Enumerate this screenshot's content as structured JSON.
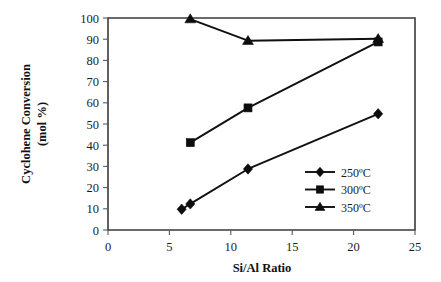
{
  "chart_data": {
    "type": "line",
    "title": "",
    "xlabel": "Si/Al Ratio",
    "ylabel_line1": "Cyclohene Conversion",
    "ylabel_line2": "(mol %)",
    "xlim": [
      0,
      25
    ],
    "ylim": [
      0,
      100
    ],
    "xticks": [
      "0",
      "5",
      "10",
      "15",
      "20",
      "25"
    ],
    "xtick_values": [
      0,
      5,
      10,
      15,
      20,
      25
    ],
    "yticks": [
      "0",
      "10",
      "20",
      "30",
      "40",
      "50",
      "60",
      "70",
      "80",
      "90",
      "100"
    ],
    "ytick_values": [
      0,
      10,
      20,
      30,
      40,
      50,
      60,
      70,
      80,
      90,
      100
    ],
    "grid": false,
    "legend_position": "lower-right-inside",
    "line_color": "#101010",
    "marker_color": "#0d0d0d",
    "frame_color": "#3a3a3a",
    "series": [
      {
        "name": "250ºC",
        "marker": "diamond",
        "x": [
          6.0,
          6.7,
          11.4,
          22.0
        ],
        "values": [
          9.8,
          12.3,
          28.8,
          54.8
        ]
      },
      {
        "name": "300ºC",
        "marker": "square",
        "x": [
          6.7,
          11.4,
          22.0
        ],
        "values": [
          41.2,
          57.6,
          88.7
        ]
      },
      {
        "name": "350ºC",
        "marker": "triangle",
        "x": [
          6.7,
          11.4,
          22.0
        ],
        "values": [
          99.5,
          89.3,
          90.2
        ]
      }
    ]
  }
}
